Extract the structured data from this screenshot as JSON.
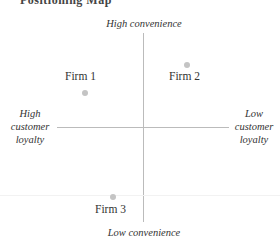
{
  "header": {
    "title": "Positioning Map"
  },
  "axes": {
    "top": "High convenience",
    "bottom": "Low convenience",
    "left": [
      "High",
      "customer",
      "loyalty"
    ],
    "right": [
      "Low",
      "customer",
      "loyalty"
    ]
  },
  "firms": [
    {
      "label": "Firm 1"
    },
    {
      "label": "Firm 2"
    },
    {
      "label": "Firm 3"
    }
  ]
}
